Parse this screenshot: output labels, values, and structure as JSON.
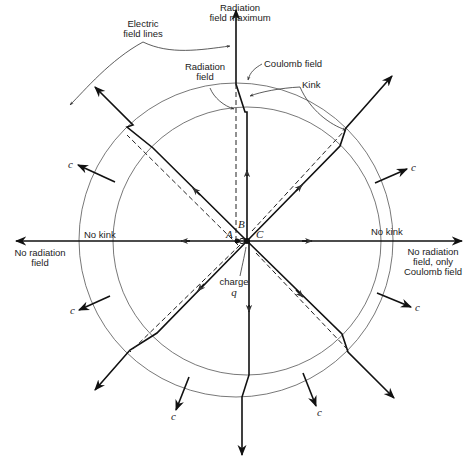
{
  "figure": {
    "labels": {
      "top": [
        "Radiation",
        "field maximum"
      ],
      "electric_field_lines": [
        "Electric",
        "field lines"
      ],
      "radiation_field": [
        "Radiation",
        "field"
      ],
      "coulomb_field": "Coulomb field",
      "kink": "Kink",
      "no_kink_left": "No kink",
      "no_kink_right": "No kink",
      "left_side": [
        "No radiation",
        "field"
      ],
      "right_side": [
        "No radiation",
        "field, only",
        "Coulomb  field"
      ],
      "charge": [
        "charge",
        "q"
      ],
      "point_a": "A",
      "point_b": "B",
      "point_c": "C",
      "velocity_label": "c"
    },
    "circles": {
      "outer": {
        "cx": 236,
        "cy": 240,
        "r": 157
      },
      "inner": {
        "cx": 247,
        "cy": 241,
        "r": 134
      }
    },
    "colors": {
      "line": "#111111",
      "circle": "#555555",
      "background": "#ffffff"
    }
  }
}
